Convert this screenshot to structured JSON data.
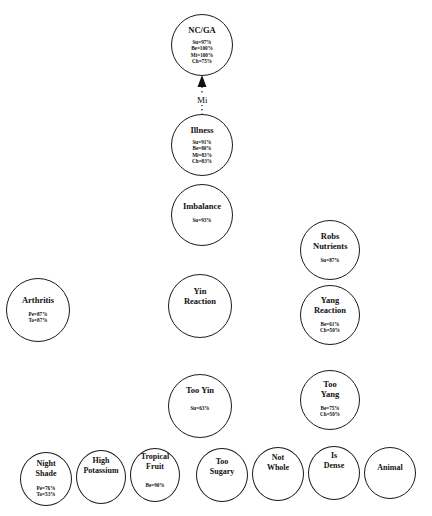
{
  "nodes": {
    "ncga": {
      "title": "NC/GA",
      "stats": [
        "Su=97%",
        "Be=100%",
        "Mi=100%",
        "Ch=75%"
      ]
    },
    "illness": {
      "title": "Illness",
      "stats": [
        "Su=91%",
        "Be=80%",
        "Mi=83%",
        "Ch=83%"
      ]
    },
    "imbalance": {
      "title": "Imbalance",
      "stats": [
        "Su=93%"
      ]
    },
    "robs_nutrients": {
      "title": "Robs Nutrients",
      "stats": [
        "Su=87%"
      ]
    },
    "arthritis": {
      "title": "Arthritis",
      "stats": [
        "Pe=87%",
        "To=87%"
      ]
    },
    "yin_reaction": {
      "title": "Yin Reaction",
      "stats": []
    },
    "yang_reaction": {
      "title": "Yang Reaction",
      "stats": [
        "Be=61%",
        "Ch=50%"
      ]
    },
    "too_yin": {
      "title": "Too Yin",
      "stats": [
        "Su=63%"
      ]
    },
    "too_yang": {
      "title": "Too Yang",
      "stats": [
        "Be=75%",
        "Ch=50%"
      ]
    },
    "night_shade": {
      "title": "Night Shade",
      "stats": [
        "Pe=76%",
        "To=53%"
      ]
    },
    "high_potassium": {
      "title": "High Potassium",
      "stats": []
    },
    "tropical_fruit": {
      "title": "Tropical Fruit",
      "stats": [
        "Be=90%"
      ]
    },
    "too_sugary": {
      "title": "Too Sugary",
      "stats": []
    },
    "not_whole": {
      "title": "Not Whole",
      "stats": []
    },
    "is_dense": {
      "title": "Is Dense",
      "stats": []
    },
    "animal": {
      "title": "Animal",
      "stats": []
    }
  },
  "edges": [
    {
      "from": "illness",
      "to": "ncga",
      "label": "Mi",
      "style": "dotted-arrow"
    }
  ]
}
